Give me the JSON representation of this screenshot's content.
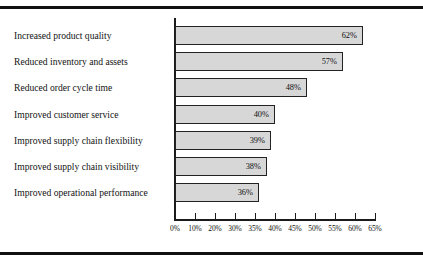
{
  "chart_data": {
    "type": "bar",
    "orientation": "horizontal",
    "title": "",
    "subtitle": "",
    "xlabel": "",
    "ylabel": "",
    "grid": false,
    "legend": null,
    "legend_position": "none",
    "xlim": [
      0,
      65
    ],
    "x_tick_labels": [
      "0%",
      "10%",
      "20%",
      "30%",
      "35%",
      "40%",
      "45%",
      "50%",
      "55%",
      "60%",
      "65%"
    ],
    "x_tick_values": [
      0,
      10,
      20,
      30,
      35,
      40,
      45,
      50,
      55,
      60,
      65
    ],
    "axis_note": "ticks are evenly spaced in pixels though label values are non-uniform",
    "categories": [
      "Increased product quality",
      "Reduced inventory and assets",
      "Reduced order cycle time",
      "Improved customer service",
      "Improved supply chain flexibility",
      "Improved supply chain visibility",
      "Improved operational performance"
    ],
    "values": [
      62,
      57,
      48,
      40,
      39,
      38,
      36
    ],
    "value_labels": [
      "62%",
      "57%",
      "48%",
      "40%",
      "39%",
      "38%",
      "36%"
    ],
    "bar_fill_color": "#d7d7d7",
    "bar_border_color": "#222222",
    "axis_color": "#1b1b1b",
    "text_color": "#121212",
    "background_color": "#ffffff",
    "rule_color": "#111111"
  }
}
